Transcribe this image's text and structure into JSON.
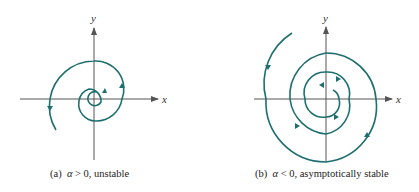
{
  "figure": {
    "panels": [
      {
        "id": "a",
        "caption_prefix": "(a)",
        "caption_symbol": "α",
        "caption_relation": "> 0, unstable",
        "x_label": "x",
        "y_label": "y",
        "behavior": "unstable spiral (outward, counterclockwise)"
      },
      {
        "id": "b",
        "caption_prefix": "(b)",
        "caption_symbol": "α",
        "caption_relation": "< 0, asymptotically stable",
        "x_label": "x",
        "y_label": "y",
        "behavior": "stable spiral (inward, counterclockwise)"
      }
    ],
    "colors": {
      "trajectory": "#1f6f6f",
      "axis": "#555555"
    }
  }
}
